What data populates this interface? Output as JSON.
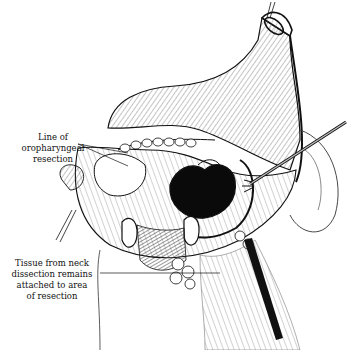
{
  "figure": {
    "type": "surgical line illustration",
    "colors": {
      "ink": "#111111",
      "background": "#ffffff",
      "hatch": "#555555"
    }
  },
  "labels": [
    {
      "id": "line-of-resection",
      "lines": [
        "Line of",
        "oropharyngeal",
        "resection"
      ]
    },
    {
      "id": "tissue-neck-dissection",
      "lines": [
        "Tissue from neck",
        "dissection remains",
        "attached to area",
        "of resection"
      ]
    }
  ]
}
